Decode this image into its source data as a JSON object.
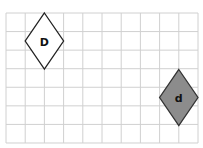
{
  "grid": {
    "origin_x": 6,
    "origin_y": 13,
    "cols": 10,
    "rows": 7,
    "cell_w": 19.2,
    "cell_h": 18.57,
    "line_color": "#d0d0d0"
  },
  "shapes": [
    {
      "id": "D",
      "label": "D",
      "type": "diamond",
      "cx": 44.4,
      "cy": 41,
      "half_w": 19.2,
      "half_h": 28,
      "fill": "#ffffff",
      "stroke": "#222222"
    },
    {
      "id": "d",
      "label": "d",
      "type": "diamond",
      "cx": 178.8,
      "cy": 97.5,
      "half_w": 19.2,
      "half_h": 28,
      "fill": "#8c8c8c",
      "stroke": "#333333"
    }
  ]
}
